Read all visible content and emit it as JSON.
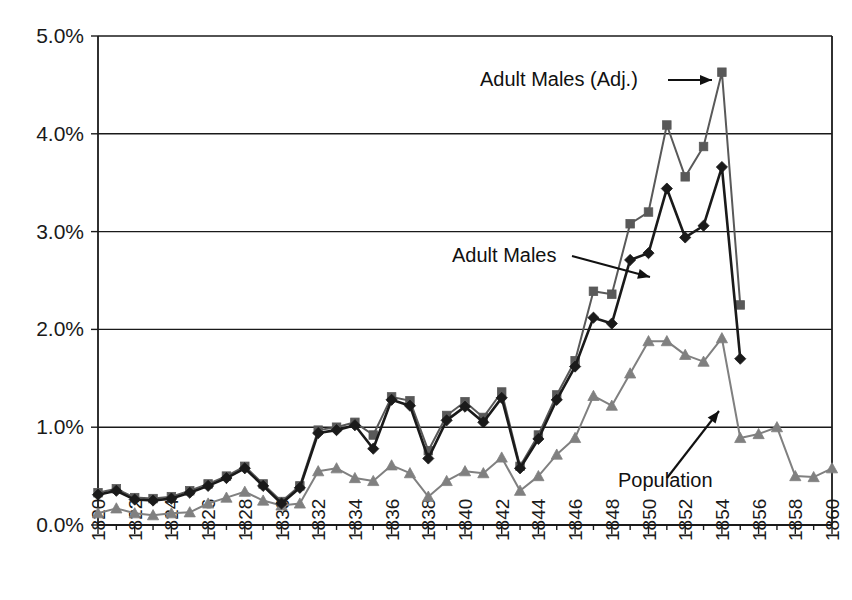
{
  "chart_data": {
    "type": "line",
    "title": "",
    "subtitle": "",
    "xlabel": "",
    "ylabel": "",
    "xlim": [
      1820,
      1860
    ],
    "ylim": [
      0.0,
      5.0
    ],
    "y_unit": "%",
    "grid": true,
    "legend_position": "inline-annotations",
    "y_ticks": [
      "0.0%",
      "1.0%",
      "2.0%",
      "3.0%",
      "4.0%",
      "5.0%"
    ],
    "y_tick_values": [
      0.0,
      1.0,
      2.0,
      3.0,
      4.0,
      5.0
    ],
    "x_ticks": [
      "1820",
      "1822",
      "1824",
      "1826",
      "1828",
      "1830",
      "1832",
      "1834",
      "1836",
      "1838",
      "1840",
      "1842",
      "1844",
      "1846",
      "1848",
      "1850",
      "1852",
      "1854",
      "1856",
      "1858",
      "1860"
    ],
    "x_tick_values": [
      1820,
      1822,
      1824,
      1826,
      1828,
      1830,
      1832,
      1834,
      1836,
      1838,
      1840,
      1842,
      1844,
      1846,
      1848,
      1850,
      1852,
      1854,
      1856,
      1858,
      1860
    ],
    "x": [
      1820,
      1821,
      1822,
      1823,
      1824,
      1825,
      1826,
      1827,
      1828,
      1829,
      1830,
      1831,
      1832,
      1833,
      1834,
      1835,
      1836,
      1837,
      1838,
      1839,
      1840,
      1841,
      1842,
      1843,
      1844,
      1845,
      1846,
      1847,
      1848,
      1849,
      1850,
      1851,
      1852,
      1853,
      1854,
      1855,
      1856,
      1857,
      1858,
      1859,
      1860
    ],
    "series": [
      {
        "name": "Adult Males (Adj.)",
        "marker": "square",
        "color": "#595959",
        "line_color": "#595959",
        "values": [
          0.33,
          0.37,
          0.28,
          0.27,
          0.29,
          0.35,
          0.42,
          0.5,
          0.6,
          0.42,
          0.24,
          0.4,
          0.97,
          1.0,
          1.05,
          0.92,
          1.31,
          1.27,
          0.76,
          1.12,
          1.26,
          1.1,
          1.36,
          0.6,
          0.92,
          1.33,
          1.68,
          2.39,
          2.36,
          3.08,
          3.2,
          4.09,
          3.56,
          3.87,
          4.63,
          2.25,
          null,
          null,
          null,
          null,
          null
        ]
      },
      {
        "name": "Adult Males",
        "marker": "diamond",
        "color": "#1a1a1a",
        "line_color": "#1a1a1a",
        "values": [
          0.31,
          0.35,
          0.26,
          0.25,
          0.27,
          0.33,
          0.4,
          0.48,
          0.58,
          0.4,
          0.22,
          0.38,
          0.94,
          0.97,
          1.02,
          0.78,
          1.28,
          1.22,
          0.68,
          1.07,
          1.21,
          1.05,
          1.3,
          0.58,
          0.88,
          1.28,
          1.62,
          2.12,
          2.06,
          2.71,
          2.78,
          3.44,
          2.94,
          3.06,
          3.66,
          1.7,
          null,
          null,
          null,
          null,
          null
        ]
      },
      {
        "name": "Population",
        "marker": "triangle",
        "color": "#808080",
        "line_color": "#808080",
        "values": [
          0.12,
          0.17,
          0.12,
          0.1,
          0.12,
          0.13,
          0.22,
          0.28,
          0.34,
          0.25,
          0.2,
          0.22,
          0.55,
          0.58,
          0.48,
          0.45,
          0.61,
          0.53,
          0.29,
          0.45,
          0.55,
          0.53,
          0.69,
          0.35,
          0.5,
          0.72,
          0.89,
          1.32,
          1.22,
          1.55,
          1.88,
          1.88,
          1.74,
          1.67,
          1.91,
          0.89,
          0.93,
          1.0,
          0.5,
          0.49,
          0.58
        ]
      }
    ],
    "annotations": [
      {
        "text": "Adult Males (Adj.)",
        "target_series": "Adult Males (Adj.)",
        "target_x": 1854,
        "target_y": 4.63
      },
      {
        "text": "Adult Males",
        "target_series": "Adult Males",
        "target_x": 1846,
        "target_y": 1.62
      },
      {
        "text": "Population",
        "target_series": "Population",
        "target_x": 1854,
        "target_y": 1.91
      }
    ]
  }
}
